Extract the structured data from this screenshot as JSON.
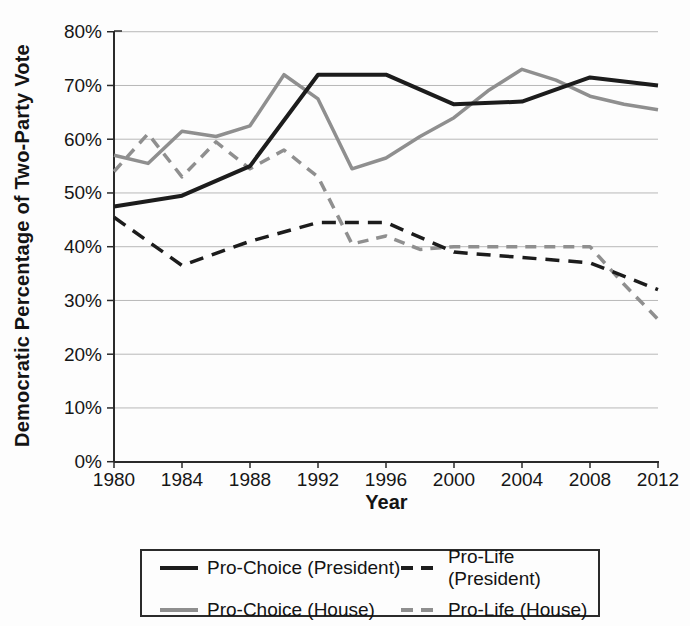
{
  "figure": {
    "y_axis": {
      "title": "Democratic Percentage of Two-Party Vote",
      "tick_labels": [
        "80%",
        "70%",
        "60%",
        "50%",
        "40%",
        "30%",
        "20%",
        "10%",
        "0%"
      ],
      "tick_values": [
        80,
        70,
        60,
        50,
        40,
        30,
        20,
        10,
        0
      ]
    },
    "x_axis": {
      "title": "Year",
      "tick_labels": [
        "1980",
        "1984",
        "1988",
        "1992",
        "1996",
        "2000",
        "2004",
        "2008",
        "2012"
      ],
      "tick_values": [
        1980,
        1984,
        1988,
        1992,
        1996,
        2000,
        2004,
        2008,
        2012
      ]
    },
    "colors": {
      "president_line": "#1c1c1c",
      "house_line": "#8f8f8f",
      "gridline": "#b8b8b8",
      "axis": "#2a2a2a"
    }
  },
  "chart_data": {
    "type": "line",
    "title": "",
    "xlabel": "Year",
    "ylabel": "Democratic Percentage of Two-Party Vote",
    "xlim": [
      1980,
      2012
    ],
    "ylim": [
      0,
      80
    ],
    "x_tick_interval": 4,
    "y_tick_interval": 10,
    "grid": "horizontal",
    "legend_position": "bottom-box",
    "series": [
      {
        "id": "pro-choice-president",
        "name": "Pro-Choice (President)",
        "style": "solid",
        "color": "#1c1c1c",
        "x": [
          1980,
          1984,
          1988,
          1992,
          1996,
          2000,
          2004,
          2008,
          2012
        ],
        "values": [
          47.5,
          49.5,
          55,
          72,
          72,
          66.5,
          67,
          71.5,
          70
        ]
      },
      {
        "id": "pro-life-president",
        "name": "Pro-Life (President)",
        "style": "dashed",
        "color": "#1c1c1c",
        "x": [
          1980,
          1984,
          1988,
          1992,
          1996,
          2000,
          2004,
          2008,
          2012
        ],
        "values": [
          45.5,
          36.5,
          41,
          44.5,
          44.5,
          39,
          38,
          37,
          32
        ]
      },
      {
        "id": "pro-choice-house",
        "name": "Pro-Choice (House)",
        "style": "solid",
        "color": "#8f8f8f",
        "x": [
          1980,
          1982,
          1984,
          1986,
          1988,
          1990,
          1992,
          1994,
          1996,
          1998,
          2000,
          2002,
          2004,
          2006,
          2008,
          2010,
          2012
        ],
        "values": [
          57,
          55.5,
          61.5,
          60.5,
          62.5,
          72,
          67.5,
          54.5,
          56.5,
          60.5,
          64,
          69,
          73,
          71,
          68,
          66.5,
          65.5
        ]
      },
      {
        "id": "pro-life-house",
        "name": "Pro-Life (House)",
        "style": "dashed",
        "color": "#8f8f8f",
        "x": [
          1980,
          1982,
          1984,
          1986,
          1988,
          1990,
          1992,
          1994,
          1996,
          1998,
          2000,
          2002,
          2004,
          2006,
          2008,
          2010,
          2012
        ],
        "values": [
          54,
          61,
          53,
          59.5,
          54.5,
          58,
          53,
          40.5,
          42,
          39.5,
          40,
          40,
          40,
          40,
          40,
          33,
          26.5
        ]
      }
    ]
  }
}
